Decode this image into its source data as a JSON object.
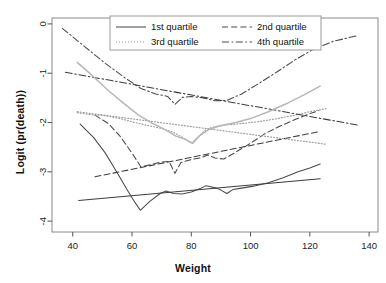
{
  "chart_data": {
    "type": "line",
    "title": "",
    "xlabel": "Weight",
    "ylabel": "Logit (pr(death))",
    "xlim": [
      33,
      143
    ],
    "ylim": [
      -4.22,
      0.12
    ],
    "xticks": [
      40,
      60,
      80,
      100,
      120,
      140
    ],
    "yticks": [
      0,
      -1,
      -2,
      -3,
      -4
    ],
    "grid": false,
    "legend_position": "top-center",
    "legend_entries": [
      {
        "label": "1st quartile",
        "style": "solid"
      },
      {
        "label": "2nd quartile",
        "style": "dashed"
      },
      {
        "label": "3rd quartile",
        "style": "dotted"
      },
      {
        "label": "4th quartile",
        "style": "dashdot"
      }
    ],
    "series": [
      {
        "name": "1st quartile (empirical)",
        "style": "solid",
        "color": "#4a4a4a",
        "points": [
          [
            42.5,
            -2.03
          ],
          [
            47.0,
            -2.3
          ],
          [
            51.0,
            -2.62
          ],
          [
            55.0,
            -3.02
          ],
          [
            58.5,
            -3.38
          ],
          [
            61.0,
            -3.62
          ],
          [
            62.8,
            -3.78
          ],
          [
            66.0,
            -3.6
          ],
          [
            69.5,
            -3.44
          ],
          [
            71.5,
            -3.39
          ],
          [
            74.0,
            -3.44
          ],
          [
            77.0,
            -3.45
          ],
          [
            80.0,
            -3.41
          ],
          [
            83.0,
            -3.34
          ],
          [
            85.0,
            -3.28
          ],
          [
            86.5,
            -3.3
          ],
          [
            88.5,
            -3.33
          ],
          [
            90.0,
            -3.37
          ],
          [
            92.0,
            -3.44
          ],
          [
            94.0,
            -3.36
          ],
          [
            97.0,
            -3.33
          ],
          [
            101.0,
            -3.29
          ],
          [
            106.0,
            -3.22
          ],
          [
            111.0,
            -3.12
          ],
          [
            116.0,
            -3.0
          ],
          [
            120.0,
            -2.92
          ],
          [
            123.5,
            -2.84
          ]
        ]
      },
      {
        "name": "1st quartile (fitted)",
        "style": "solid",
        "color": "#3d3d3d",
        "points": [
          [
            42.0,
            -3.58
          ],
          [
            123.5,
            -3.14
          ]
        ]
      },
      {
        "name": "2nd quartile (empirical)",
        "style": "dashed",
        "color": "#4a4a4a",
        "points": [
          [
            47.5,
            -1.85
          ],
          [
            52.0,
            -2.02
          ],
          [
            56.0,
            -2.28
          ],
          [
            60.0,
            -2.62
          ],
          [
            63.0,
            -2.9
          ],
          [
            66.5,
            -2.85
          ],
          [
            70.0,
            -2.8
          ],
          [
            72.5,
            -2.79
          ],
          [
            74.5,
            -3.03
          ],
          [
            76.5,
            -2.81
          ],
          [
            80.0,
            -2.75
          ],
          [
            83.0,
            -2.72
          ],
          [
            85.5,
            -2.66
          ],
          [
            88.0,
            -2.72
          ],
          [
            91.0,
            -2.74
          ],
          [
            95.0,
            -2.6
          ],
          [
            100.0,
            -2.42
          ],
          [
            105.0,
            -2.22
          ],
          [
            110.0,
            -2.07
          ],
          [
            115.0,
            -1.94
          ],
          [
            119.0,
            -1.84
          ],
          [
            123.0,
            -1.76
          ]
        ]
      },
      {
        "name": "2nd quartile (fitted)",
        "style": "dashed",
        "color": "#3d3d3d",
        "points": [
          [
            47.5,
            -3.1
          ],
          [
            123.5,
            -2.18
          ]
        ]
      },
      {
        "name": "3rd quartile (empirical)",
        "style": "dotted",
        "color": "#9a9a9a",
        "points": [
          [
            41.5,
            -1.8
          ],
          [
            46.0,
            -1.84
          ],
          [
            51.0,
            -1.86
          ],
          [
            56.0,
            -1.92
          ],
          [
            61.0,
            -2.0
          ],
          [
            66.0,
            -2.07
          ],
          [
            70.0,
            -2.12
          ],
          [
            74.0,
            -2.2
          ],
          [
            77.0,
            -2.3
          ],
          [
            80.0,
            -2.42
          ],
          [
            82.5,
            -2.28
          ],
          [
            85.0,
            -2.14
          ],
          [
            88.0,
            -2.08
          ],
          [
            92.0,
            -2.05
          ],
          [
            97.0,
            -2.02
          ],
          [
            103.0,
            -1.98
          ],
          [
            109.0,
            -1.92
          ],
          [
            115.0,
            -1.85
          ],
          [
            120.0,
            -1.78
          ],
          [
            125.5,
            -1.72
          ]
        ]
      },
      {
        "name": "3rd quartile (fitted)",
        "style": "dotted",
        "color": "#9a9a9a",
        "points": [
          [
            41.5,
            -1.78
          ],
          [
            125.5,
            -2.44
          ]
        ]
      },
      {
        "name": "4th quartile (empirical)",
        "style": "dashdot",
        "color": "#4a4a4a",
        "points": [
          [
            36.5,
            -0.09
          ],
          [
            44.0,
            -0.46
          ],
          [
            51.0,
            -0.8
          ],
          [
            58.0,
            -1.11
          ],
          [
            63.0,
            -1.31
          ],
          [
            68.0,
            -1.42
          ],
          [
            72.0,
            -1.47
          ],
          [
            74.5,
            -1.63
          ],
          [
            77.0,
            -1.49
          ],
          [
            80.0,
            -1.47
          ],
          [
            84.0,
            -1.5
          ],
          [
            88.0,
            -1.56
          ],
          [
            92.0,
            -1.55
          ],
          [
            97.0,
            -1.42
          ],
          [
            103.0,
            -1.2
          ],
          [
            109.0,
            -0.97
          ],
          [
            115.0,
            -0.73
          ],
          [
            121.0,
            -0.52
          ],
          [
            128.0,
            -0.35
          ],
          [
            136.0,
            -0.24
          ]
        ]
      },
      {
        "name": "4th quartile (fitted)",
        "style": "dashdot",
        "color": "#3d3d3d",
        "points": [
          [
            37.5,
            -0.98
          ],
          [
            136.0,
            -2.05
          ]
        ]
      },
      {
        "name": "4th quartile (secondary)",
        "style": "solid-light",
        "color": "#b7b7b7",
        "points": [
          [
            41.5,
            -0.78
          ],
          [
            47.0,
            -1.07
          ],
          [
            52.0,
            -1.35
          ],
          [
            57.0,
            -1.6
          ],
          [
            62.0,
            -1.84
          ],
          [
            67.0,
            -2.02
          ],
          [
            71.0,
            -2.14
          ],
          [
            75.0,
            -2.28
          ],
          [
            78.0,
            -2.34
          ],
          [
            80.5,
            -2.42
          ],
          [
            83.0,
            -2.26
          ],
          [
            86.0,
            -2.14
          ],
          [
            90.0,
            -2.06
          ],
          [
            95.0,
            -2.0
          ],
          [
            100.0,
            -1.92
          ],
          [
            106.0,
            -1.78
          ],
          [
            112.0,
            -1.62
          ],
          [
            118.0,
            -1.44
          ],
          [
            123.5,
            -1.26
          ]
        ]
      }
    ]
  },
  "axes": {
    "xlabel": "Weight",
    "ylabel": "Logit (pr(death))",
    "xtick_labels": [
      "40",
      "60",
      "80",
      "100",
      "120",
      "140"
    ],
    "ytick_labels": [
      "0",
      "-1",
      "-2",
      "-3",
      "-4"
    ]
  },
  "legend": {
    "items": [
      {
        "label": "1st quartile"
      },
      {
        "label": "2nd quartile"
      },
      {
        "label": "3rd quartile"
      },
      {
        "label": "4th quartile"
      }
    ]
  },
  "colors": {
    "frame": "#8a8a8a",
    "dark_line": "#4a4a4a",
    "light_line": "#9a9a9a",
    "grey_line": "#b7b7b7",
    "background": "#ffffff"
  }
}
